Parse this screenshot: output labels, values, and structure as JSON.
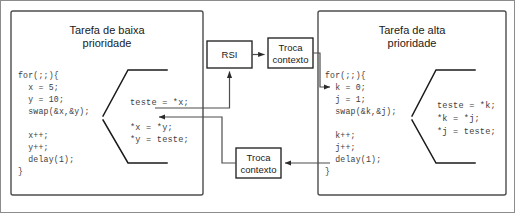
{
  "figure": {
    "colors": {
      "panel_border": "#4d4d4d",
      "box_border": "#1a1a1a",
      "code_text": "#3d3d3d",
      "line": "#4d4d4d",
      "background": "#ffffff"
    }
  },
  "low_priority_task": {
    "title_line1": "Tarefa de baixa",
    "title_line2": "prioridade",
    "code_lines": [
      "for(;;){",
      "  x = 5;",
      "  y = 10;",
      "  swap(&x,&y);",
      "",
      "  x++;",
      "  y++;",
      "  delay(1);",
      "}"
    ],
    "snippet_lines": [
      "teste = *x;",
      "",
      "*x = *y;",
      "*y = teste;"
    ]
  },
  "high_priority_task": {
    "title_line1": "Tarefa de alta",
    "title_line2": "prioridade",
    "code_lines": [
      "for(;;){",
      "  k = 0;",
      "  j = 1;",
      "  swap(&k,&j);",
      "",
      "  k++;",
      "  j++;",
      "  delay(1);",
      "}"
    ],
    "snippet_lines": [
      "teste = *k;",
      "*k = *j;",
      "*j = teste;"
    ]
  },
  "isr_box": {
    "label": "RSI"
  },
  "context_switch_top": {
    "label_line1": "Troca",
    "label_line2": "contexto"
  },
  "context_switch_bottom": {
    "label_line1": "Troca",
    "label_line2": "contexto"
  }
}
